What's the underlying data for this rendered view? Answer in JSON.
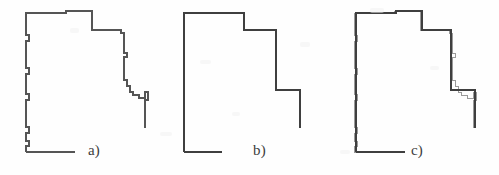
{
  "figure": {
    "type": "line-drawing",
    "caption_labels": [
      "a)",
      "b)",
      "c)"
    ],
    "background_color": "#fefefe",
    "stroke_color_raw": "#555555",
    "stroke_color_simplified": "#3f3f3f",
    "stroke_color_overlay_thin": "#9a9a9a",
    "panel_width": 166,
    "panel_height": 175
  },
  "panels": [
    {
      "id": "a",
      "label": "a)",
      "description": "raw digitized staircase outline",
      "label_x": 88,
      "label_y": 142
    },
    {
      "id": "b",
      "label": "b)",
      "description": "simplified polygonal outline",
      "label_x": 87,
      "label_y": 142
    },
    {
      "id": "c",
      "label": "c)",
      "description": "overlay of raw and simplified outlines",
      "label_x": 79,
      "label_y": 142
    }
  ],
  "chart_data": {
    "type": "line",
    "title": "",
    "subtitle": "",
    "xlabel": "",
    "ylabel": "",
    "grid": false,
    "legend": "none",
    "xlim": [
      0,
      166
    ],
    "ylim": [
      0,
      175
    ],
    "annotations": [
      "a)",
      "b)",
      "c)"
    ],
    "series": [
      {
        "name": "raw_staircase_outline",
        "panel": "a",
        "closed": false,
        "stroke": "#555555",
        "stroke_width": 1.1,
        "points": [
          [
            26,
            152
          ],
          [
            26,
            146
          ],
          [
            29,
            146
          ],
          [
            29,
            141
          ],
          [
            26,
            141
          ],
          [
            26,
            133
          ],
          [
            29,
            133
          ],
          [
            29,
            127
          ],
          [
            26,
            127
          ],
          [
            26,
            100
          ],
          [
            29,
            100
          ],
          [
            29,
            94
          ],
          [
            26,
            94
          ],
          [
            26,
            74
          ],
          [
            29,
            74
          ],
          [
            29,
            68
          ],
          [
            26,
            68
          ],
          [
            26,
            41
          ],
          [
            29,
            41
          ],
          [
            29,
            35
          ],
          [
            26,
            35
          ],
          [
            26,
            13
          ],
          [
            66,
            13
          ],
          [
            66,
            11
          ],
          [
            92,
            11
          ],
          [
            92,
            30
          ],
          [
            121,
            30
          ],
          [
            121,
            33
          ],
          [
            124,
            33
          ],
          [
            124,
            53
          ],
          [
            127,
            53
          ],
          [
            127,
            57
          ],
          [
            124,
            57
          ],
          [
            124,
            80
          ],
          [
            127,
            80
          ],
          [
            127,
            86
          ],
          [
            130,
            86
          ],
          [
            130,
            92
          ],
          [
            133,
            92
          ],
          [
            133,
            95
          ],
          [
            139,
            95
          ],
          [
            139,
            98
          ],
          [
            145,
            98
          ],
          [
            145,
            92
          ],
          [
            148,
            92
          ],
          [
            148,
            100
          ],
          [
            145,
            100
          ],
          [
            145,
            128
          ]
        ]
      },
      {
        "name": "raw_outline_bottom_segment",
        "panel": "a",
        "closed": false,
        "stroke": "#555555",
        "stroke_width": 1.1,
        "points": [
          [
            26,
            152
          ],
          [
            75,
            152
          ]
        ]
      },
      {
        "name": "simplified_outline",
        "panel": "b",
        "closed": false,
        "stroke": "#3f3f3f",
        "stroke_width": 1.4,
        "points": [
          [
            18,
            152
          ],
          [
            18,
            13
          ],
          [
            78,
            13
          ],
          [
            78,
            30
          ],
          [
            110,
            30
          ],
          [
            110,
            90
          ],
          [
            134,
            90
          ],
          [
            134,
            128
          ]
        ]
      },
      {
        "name": "simplified_outline_bottom_segment",
        "panel": "b",
        "closed": false,
        "stroke": "#3f3f3f",
        "stroke_width": 1.4,
        "points": [
          [
            18,
            152
          ],
          [
            56,
            152
          ]
        ]
      },
      {
        "name": "overlay_raw_outline",
        "panel": "c",
        "closed": false,
        "stroke": "#9a9a9a",
        "stroke_width": 1.0,
        "points": [
          [
            22,
            152
          ],
          [
            22,
            146
          ],
          [
            25,
            146
          ],
          [
            25,
            141
          ],
          [
            22,
            141
          ],
          [
            22,
            133
          ],
          [
            25,
            133
          ],
          [
            25,
            127
          ],
          [
            22,
            127
          ],
          [
            22,
            100
          ],
          [
            25,
            100
          ],
          [
            25,
            94
          ],
          [
            22,
            94
          ],
          [
            22,
            74
          ],
          [
            25,
            74
          ],
          [
            25,
            68
          ],
          [
            22,
            68
          ],
          [
            22,
            41
          ],
          [
            25,
            41
          ],
          [
            25,
            35
          ],
          [
            22,
            35
          ],
          [
            22,
            13
          ],
          [
            62,
            13
          ],
          [
            62,
            11
          ],
          [
            88,
            11
          ],
          [
            88,
            30
          ],
          [
            117,
            30
          ],
          [
            117,
            33
          ],
          [
            120,
            33
          ],
          [
            120,
            53
          ],
          [
            123,
            53
          ],
          [
            123,
            57
          ],
          [
            120,
            57
          ],
          [
            120,
            80
          ],
          [
            123,
            80
          ],
          [
            123,
            86
          ],
          [
            126,
            86
          ],
          [
            126,
            92
          ],
          [
            129,
            92
          ],
          [
            129,
            95
          ],
          [
            135,
            95
          ],
          [
            135,
            98
          ],
          [
            141,
            98
          ],
          [
            141,
            92
          ],
          [
            144,
            92
          ],
          [
            144,
            100
          ],
          [
            141,
            100
          ],
          [
            141,
            128
          ]
        ]
      },
      {
        "name": "overlay_raw_bottom_segment",
        "panel": "c",
        "closed": false,
        "stroke": "#9a9a9a",
        "stroke_width": 1.0,
        "points": [
          [
            22,
            152
          ],
          [
            71,
            152
          ]
        ]
      },
      {
        "name": "overlay_simplified_outline",
        "panel": "c",
        "closed": false,
        "stroke": "#3f3f3f",
        "stroke_width": 1.3,
        "points": [
          [
            24,
            152
          ],
          [
            24,
            13
          ],
          [
            64,
            13
          ],
          [
            64,
            11
          ],
          [
            90,
            11
          ],
          [
            90,
            30
          ],
          [
            119,
            30
          ],
          [
            119,
            90
          ],
          [
            143,
            90
          ],
          [
            143,
            128
          ]
        ]
      },
      {
        "name": "overlay_simplified_bottom_segment",
        "panel": "c",
        "closed": false,
        "stroke": "#3f3f3f",
        "stroke_width": 1.3,
        "points": [
          [
            24,
            152
          ],
          [
            73,
            152
          ]
        ]
      }
    ]
  }
}
